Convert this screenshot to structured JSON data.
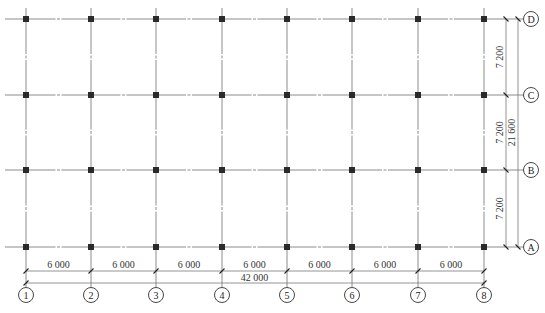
{
  "drawing": {
    "title": "Column grid plan",
    "units": "mm",
    "colors": {
      "grid": "#8c8c8c",
      "column": "#2a2a2a",
      "bubble_stroke": "#333333",
      "text": "#222222"
    },
    "vertical_axes": [
      {
        "label": "1",
        "x": 26
      },
      {
        "label": "2",
        "x": 91
      },
      {
        "label": "3",
        "x": 156
      },
      {
        "label": "4",
        "x": 222
      },
      {
        "label": "5",
        "x": 287
      },
      {
        "label": "6",
        "x": 352
      },
      {
        "label": "7",
        "x": 418
      },
      {
        "label": "8",
        "x": 484
      }
    ],
    "horizontal_axes": [
      {
        "label": "D",
        "y": 19
      },
      {
        "label": "C",
        "y": 95
      },
      {
        "label": "B",
        "y": 170
      },
      {
        "label": "A",
        "y": 247
      }
    ],
    "bottom_dimensions": {
      "spans": [
        "6 000",
        "6 000",
        "6 000",
        "6 000",
        "6 000",
        "6 000",
        "6 000"
      ],
      "total": "42 000"
    },
    "right_dimensions": {
      "spans": [
        "7 200",
        "7 200",
        "7 200"
      ],
      "total": "21 600"
    }
  }
}
